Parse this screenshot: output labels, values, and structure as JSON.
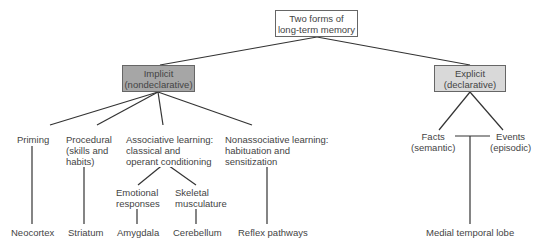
{
  "root": {
    "label": "Two forms of\nlong-term memory",
    "fill": "#ffffff"
  },
  "implicit": {
    "label": "Implicit\n(nondeclarative)",
    "fill": "#a6a6a6"
  },
  "explicit": {
    "label": "Explicit\n(declarative)",
    "fill": "#d9d9d9"
  },
  "implicit_children": [
    {
      "label": "Priming",
      "region": "Neocortex"
    },
    {
      "label": "Procedural\n(skills and\nhabits)",
      "region": "Striatum"
    },
    {
      "label": "Associative learning:\nclassical and\noperant conditioning"
    },
    {
      "label": "Nonassociative learning:\nhabituation and\nsensitization",
      "region": "Reflex pathways"
    }
  ],
  "associative_children": [
    {
      "label": "Emotional\nresponses",
      "region": "Amygdala"
    },
    {
      "label": "Skeletal\nmusculature",
      "region": "Cerebellum"
    }
  ],
  "explicit_children": [
    {
      "label": "Facts\n(semantic)"
    },
    {
      "label": "Events\n(episodic)"
    }
  ],
  "explicit_region": "Medial temporal lobe"
}
